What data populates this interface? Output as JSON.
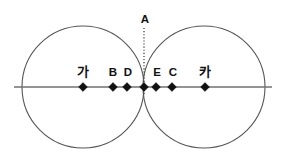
{
  "figure": {
    "canvas": {
      "width": 285,
      "height": 165,
      "background": "#ffffff"
    },
    "colors": {
      "circle_stroke": "#555555",
      "axis_stroke": "#707070",
      "dotted_stroke": "#4a4a4a",
      "marker_fill": "#111111",
      "label_text": "#111111"
    },
    "circles": [
      {
        "name": "left-circle",
        "cx": 83,
        "cy": 87,
        "r": 61
      },
      {
        "name": "right-circle",
        "cx": 204,
        "cy": 87,
        "r": 61
      }
    ],
    "axis": {
      "name": "horizontal-axis",
      "x1": 14,
      "y1": 87,
      "x2": 272,
      "y2": 87
    },
    "dotted_guide": {
      "name": "vertical-dotted-line",
      "x": 144,
      "y1": 28,
      "y2": 95
    },
    "apex": {
      "label": "A",
      "x": 145,
      "y": 23
    },
    "tangent_point": {
      "x": 144,
      "y": 87
    },
    "points": [
      {
        "id": "ga",
        "label": "가",
        "x": 83,
        "y": 87,
        "label_x": 83,
        "label_y": 76,
        "script": "hangul"
      },
      {
        "id": "B",
        "label": "B",
        "x": 113,
        "y": 87,
        "label_x": 113,
        "label_y": 76,
        "script": "latin"
      },
      {
        "id": "D",
        "label": "D",
        "x": 127,
        "y": 87,
        "label_x": 128,
        "label_y": 76,
        "script": "latin"
      },
      {
        "id": "apex-foot",
        "label": "",
        "x": 144,
        "y": 87,
        "label_x": 144,
        "label_y": 76,
        "script": "none"
      },
      {
        "id": "E",
        "label": "E",
        "x": 156,
        "y": 87,
        "label_x": 157,
        "label_y": 76,
        "script": "latin"
      },
      {
        "id": "C",
        "label": "C",
        "x": 172,
        "y": 87,
        "label_x": 173,
        "label_y": 76,
        "script": "latin"
      },
      {
        "id": "ka",
        "label": "카",
        "x": 205,
        "y": 87,
        "label_x": 205,
        "label_y": 76,
        "script": "hangul"
      }
    ]
  }
}
